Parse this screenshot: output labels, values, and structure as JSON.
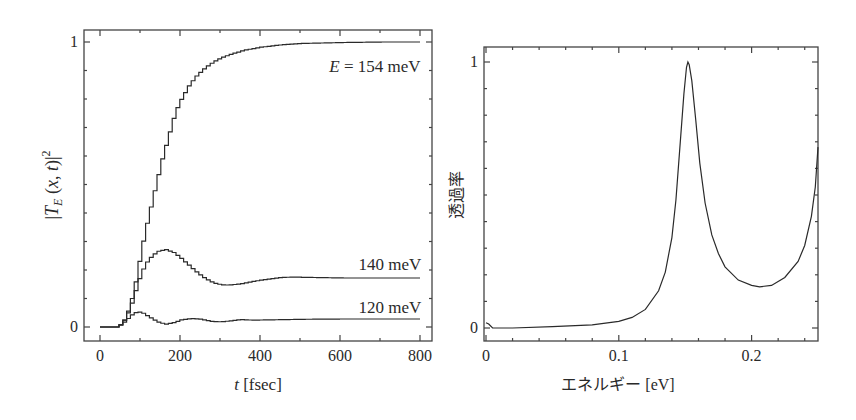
{
  "chart_data": [
    {
      "type": "line",
      "title": "",
      "xlabel": "t [fsec]",
      "ylabel": "|T_E(x, t)|^2",
      "xlim": [
        -40,
        820
      ],
      "ylim": [
        -0.05,
        1.04
      ],
      "x_ticks": [
        0,
        200,
        400,
        600,
        800
      ],
      "x_tick_labels": [
        "0",
        "200",
        "400",
        "600",
        "800"
      ],
      "x_minor_step": 100,
      "y_ticks": [
        0,
        1
      ],
      "y_tick_labels": [
        "0",
        "1"
      ],
      "y_minor_step": 0.1,
      "grid": false,
      "legend": "inline annotations",
      "step_style": true,
      "series": [
        {
          "name": "E = 154 meV",
          "label": "E = 154 meV",
          "x": [
            0,
            40,
            50,
            60,
            70,
            80,
            90,
            100,
            110,
            120,
            130,
            140,
            150,
            160,
            170,
            180,
            190,
            200,
            220,
            240,
            260,
            280,
            300,
            330,
            360,
            400,
            450,
            500,
            600,
            700,
            800
          ],
          "y": [
            0,
            0,
            0.01,
            0.03,
            0.07,
            0.12,
            0.19,
            0.27,
            0.34,
            0.4,
            0.46,
            0.52,
            0.58,
            0.63,
            0.68,
            0.73,
            0.77,
            0.8,
            0.85,
            0.885,
            0.91,
            0.93,
            0.945,
            0.96,
            0.972,
            0.982,
            0.99,
            0.995,
            0.998,
            1.0,
            1.0
          ]
        },
        {
          "name": "140 meV",
          "label": "140 meV",
          "x": [
            0,
            40,
            50,
            60,
            70,
            80,
            90,
            100,
            110,
            120,
            140,
            160,
            180,
            200,
            220,
            240,
            260,
            280,
            300,
            320,
            350,
            400,
            450,
            480,
            520,
            600,
            700,
            800
          ],
          "y": [
            0,
            0,
            0.01,
            0.03,
            0.06,
            0.1,
            0.15,
            0.19,
            0.22,
            0.24,
            0.265,
            0.272,
            0.262,
            0.24,
            0.215,
            0.19,
            0.17,
            0.155,
            0.148,
            0.147,
            0.152,
            0.165,
            0.174,
            0.175,
            0.174,
            0.172,
            0.172,
            0.172
          ]
        },
        {
          "name": "120 meV",
          "label": "120 meV",
          "x": [
            0,
            40,
            50,
            60,
            70,
            80,
            92,
            105,
            120,
            140,
            160,
            180,
            200,
            225,
            250,
            275,
            300,
            325,
            350,
            380,
            420,
            500,
            600,
            700,
            800
          ],
          "y": [
            0,
            0,
            0.01,
            0.02,
            0.035,
            0.048,
            0.053,
            0.048,
            0.035,
            0.018,
            0.01,
            0.015,
            0.025,
            0.03,
            0.027,
            0.02,
            0.018,
            0.022,
            0.026,
            0.024,
            0.025,
            0.027,
            0.028,
            0.028,
            0.028
          ]
        }
      ]
    },
    {
      "type": "line",
      "title": "",
      "xlabel": "エネルギー [eV]",
      "ylabel": "透過率",
      "xlim": [
        0,
        0.25
      ],
      "ylim": [
        -0.05,
        1.05
      ],
      "x_ticks": [
        0,
        0.1,
        0.2
      ],
      "x_tick_labels": [
        "0",
        "0.1",
        "0.2"
      ],
      "x_minor_step": 0.02,
      "y_ticks": [
        0,
        1
      ],
      "y_tick_labels": [
        "0",
        "1"
      ],
      "y_minor_step": 0.1,
      "grid": false,
      "legend": "none",
      "series": [
        {
          "name": "transmission",
          "x": [
            0,
            0.002,
            0.005,
            0.02,
            0.05,
            0.08,
            0.1,
            0.11,
            0.12,
            0.13,
            0.135,
            0.14,
            0.143,
            0.146,
            0.149,
            0.151,
            0.152,
            0.153,
            0.155,
            0.158,
            0.161,
            0.165,
            0.17,
            0.175,
            0.18,
            0.19,
            0.2,
            0.206,
            0.215,
            0.225,
            0.235,
            0.24,
            0.245,
            0.248,
            0.25
          ],
          "y": [
            0.02,
            0.015,
            0.0,
            0.0,
            0.005,
            0.012,
            0.025,
            0.04,
            0.07,
            0.14,
            0.21,
            0.34,
            0.48,
            0.68,
            0.88,
            0.98,
            1.0,
            0.99,
            0.93,
            0.78,
            0.62,
            0.47,
            0.35,
            0.28,
            0.23,
            0.18,
            0.16,
            0.155,
            0.16,
            0.19,
            0.25,
            0.31,
            0.42,
            0.53,
            0.68
          ]
        }
      ]
    }
  ]
}
